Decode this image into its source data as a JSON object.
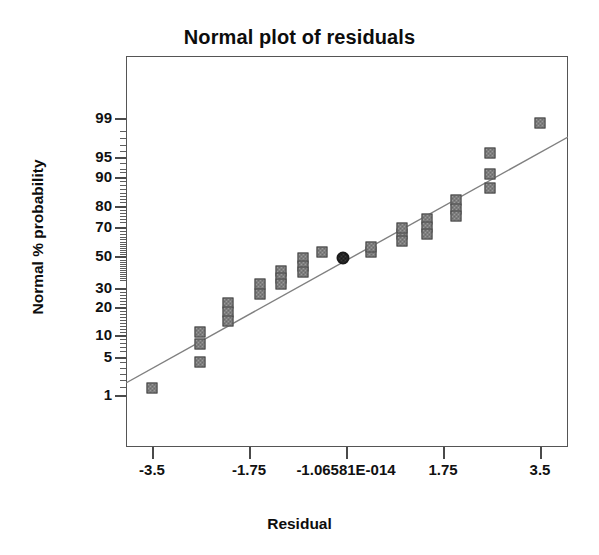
{
  "chart_data": {
    "type": "scatter",
    "title": "Normal plot of residuals",
    "xlabel": "Residual",
    "ylabel": "Normal % probability",
    "grid": false,
    "legend": null,
    "xlim": [
      -4.375,
      4.375
    ],
    "ylim_probability": [
      0.4,
      99.7
    ],
    "xticks": [
      {
        "label": "-3.5",
        "value": -3.5
      },
      {
        "label": "-1.75",
        "value": -1.75
      },
      {
        "label": "-1.06581E-014",
        "value": 0
      },
      {
        "label": "1.75",
        "value": 1.75
      },
      {
        "label": "3.5",
        "value": 3.5
      }
    ],
    "yticks": [
      {
        "label": "99",
        "value": 99
      },
      {
        "label": "95",
        "value": 95
      },
      {
        "label": "90",
        "value": 90
      },
      {
        "label": "80",
        "value": 80
      },
      {
        "label": "70",
        "value": 70
      },
      {
        "label": "50",
        "value": 50
      },
      {
        "label": "30",
        "value": 30
      },
      {
        "label": "20",
        "value": 20
      },
      {
        "label": "10",
        "value": 10
      },
      {
        "label": "5",
        "value": 5
      },
      {
        "label": "1",
        "value": 1
      }
    ],
    "reference_line": {
      "x_start": -4.375,
      "y_start_px": 383,
      "x_end": 4.375,
      "y_end_px": 137
    },
    "points": [
      {
        "x": -3.5,
        "probability": 2.0,
        "px": 152,
        "py": 388,
        "highlighted": false
      },
      {
        "x": -2.63,
        "probability": 10.5,
        "px": 200,
        "py": 332,
        "highlighted": false
      },
      {
        "x": -2.63,
        "probability": 7.5,
        "px": 200,
        "py": 344,
        "highlighted": false
      },
      {
        "x": -2.63,
        "probability": 4.5,
        "px": 200,
        "py": 362,
        "highlighted": false
      },
      {
        "x": -2.12,
        "probability": 21.0,
        "px": 228,
        "py": 303,
        "highlighted": false
      },
      {
        "x": -2.12,
        "probability": 17.5,
        "px": 228,
        "py": 312,
        "highlighted": false
      },
      {
        "x": -2.12,
        "probability": 14.5,
        "px": 228,
        "py": 321,
        "highlighted": false
      },
      {
        "x": -1.55,
        "probability": 30.0,
        "px": 260,
        "py": 284,
        "highlighted": false
      },
      {
        "x": -1.55,
        "probability": 25.0,
        "px": 260,
        "py": 294,
        "highlighted": false
      },
      {
        "x": -1.35,
        "probability": 38.0,
        "px": 281,
        "py": 271,
        "highlighted": false
      },
      {
        "x": -1.35,
        "probability": 34.0,
        "px": 281,
        "py": 278,
        "highlighted": false
      },
      {
        "x": -1.35,
        "probability": 32.0,
        "px": 281,
        "py": 284,
        "highlighted": false
      },
      {
        "x": -0.8,
        "probability": 47.0,
        "px": 303,
        "py": 258,
        "highlighted": false
      },
      {
        "x": -0.8,
        "probability": 43.0,
        "px": 303,
        "py": 266,
        "highlighted": false
      },
      {
        "x": -0.8,
        "probability": 41.0,
        "px": 303,
        "py": 272,
        "highlighted": false
      },
      {
        "x": -0.35,
        "probability": 50.0,
        "px": 322,
        "py": 252,
        "highlighted": false
      },
      {
        "x": -0.05,
        "probability": 52.0,
        "px": 343,
        "py": 258,
        "highlighted": true
      },
      {
        "x": 0.45,
        "probability": 53.0,
        "px": 371,
        "py": 252,
        "highlighted": false
      },
      {
        "x": 0.42,
        "probability": 54.0,
        "px": 371,
        "py": 247,
        "highlighted": false
      },
      {
        "x": 1.0,
        "probability": 64.0,
        "px": 402,
        "py": 234,
        "highlighted": false
      },
      {
        "x": 1.0,
        "probability": 61.0,
        "px": 402,
        "py": 241,
        "highlighted": false
      },
      {
        "x": 1.0,
        "probability": 67.0,
        "px": 402,
        "py": 228,
        "highlighted": false
      },
      {
        "x": 1.48,
        "probability": 76.0,
        "px": 427,
        "py": 219,
        "highlighted": false
      },
      {
        "x": 1.48,
        "probability": 73.0,
        "px": 427,
        "py": 227,
        "highlighted": false
      },
      {
        "x": 1.48,
        "probability": 71.0,
        "px": 427,
        "py": 234,
        "highlighted": false
      },
      {
        "x": 2.05,
        "probability": 85.0,
        "px": 456,
        "py": 200,
        "highlighted": false
      },
      {
        "x": 2.05,
        "probability": 82.0,
        "px": 456,
        "py": 209,
        "highlighted": false
      },
      {
        "x": 2.05,
        "probability": 80.0,
        "px": 456,
        "py": 216,
        "highlighted": false
      },
      {
        "x": 2.62,
        "probability": 96.0,
        "px": 490,
        "py": 153,
        "highlighted": false
      },
      {
        "x": 2.62,
        "probability": 92.0,
        "px": 490,
        "py": 174,
        "highlighted": false
      },
      {
        "x": 2.62,
        "probability": 90.0,
        "px": 490,
        "py": 188,
        "highlighted": false
      },
      {
        "x": 3.5,
        "probability": 98.5,
        "px": 540,
        "py": 123,
        "highlighted": false
      }
    ],
    "y_minor_ticks_px": [
      131,
      138,
      145,
      151,
      163,
      169,
      172,
      181,
      185,
      189,
      193,
      196,
      199,
      202,
      210,
      213,
      216,
      219,
      222,
      231,
      234,
      237,
      239,
      242,
      244,
      246,
      248,
      250,
      252,
      254,
      260,
      262,
      264,
      266,
      268,
      270,
      272,
      274,
      276,
      278,
      280,
      292,
      295,
      298,
      301,
      304,
      311,
      314,
      317,
      320,
      323,
      326,
      329,
      332,
      339,
      343,
      347,
      351,
      362,
      368,
      374,
      380,
      387
    ]
  },
  "colors": {
    "frame": "#555555",
    "line": "#777777",
    "marker_fill": "#9a9a9a",
    "marker_edge": "#3b3b3b",
    "highlight": "#1a1a1a",
    "text": "#111111",
    "background": "#ffffff"
  }
}
